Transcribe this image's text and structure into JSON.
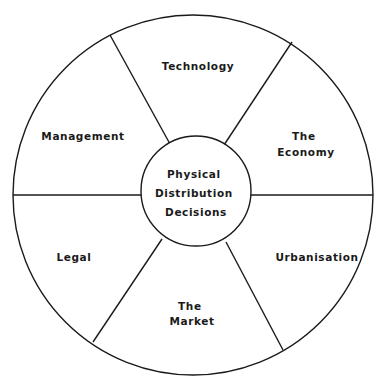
{
  "diagram": {
    "center": {
      "lines": [
        "Physical",
        "Distribution",
        "Decisions"
      ]
    },
    "segments": [
      {
        "id": "technology",
        "lines": [
          "Technology"
        ]
      },
      {
        "id": "the-economy",
        "lines": [
          "The",
          "Economy"
        ]
      },
      {
        "id": "urbanisation",
        "lines": [
          "Urbanisation"
        ]
      },
      {
        "id": "the-market",
        "lines": [
          "The",
          "Market"
        ]
      },
      {
        "id": "legal",
        "lines": [
          "Legal"
        ]
      },
      {
        "id": "management",
        "lines": [
          "Management"
        ]
      }
    ],
    "colors": {
      "stroke": "#1a1a1a",
      "background": "#ffffff"
    }
  }
}
